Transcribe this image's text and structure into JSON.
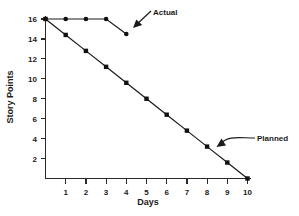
{
  "chart_data": {
    "type": "line",
    "title": "",
    "xlabel": "Days",
    "ylabel": "Story Points",
    "xlim": [
      0,
      10
    ],
    "ylim": [
      0,
      16
    ],
    "grid": false,
    "legend_position": "annotations",
    "x_ticks": [
      "1",
      "2",
      "3",
      "4",
      "5",
      "6",
      "7",
      "8",
      "9",
      "10"
    ],
    "x_tick_values": [
      1,
      2,
      3,
      4,
      5,
      6,
      7,
      8,
      9,
      10
    ],
    "y_ticks": [
      "2",
      "4",
      "6",
      "8",
      "10",
      "12",
      "14",
      "16"
    ],
    "y_tick_values": [
      2,
      4,
      6,
      8,
      10,
      12,
      14,
      16
    ],
    "series": [
      {
        "name": "Actual",
        "marker": "circle",
        "x": [
          0,
          1,
          2,
          3,
          4
        ],
        "values": [
          16,
          16,
          16,
          16,
          14.5
        ]
      },
      {
        "name": "Planned",
        "marker": "square",
        "x": [
          0,
          1,
          2,
          3,
          4,
          5,
          6,
          7,
          8,
          9,
          10
        ],
        "values": [
          16,
          14.4,
          12.8,
          11.2,
          9.6,
          8.0,
          6.4,
          4.8,
          3.2,
          1.6,
          0
        ]
      }
    ],
    "annotations": [
      {
        "label": "Actual",
        "target_x": 3.5,
        "target_y": 15.3,
        "style": "straight-arrow"
      },
      {
        "label": "Planned",
        "target_x": 8.5,
        "target_y": 2.4,
        "style": "curved-arrow"
      }
    ],
    "colors": {
      "actual_line": "#1a1a1a",
      "planned_line": "#1a1a1a",
      "axis": "#2a2a2a",
      "background": "#ffffff",
      "text": "#1a1a1a"
    }
  }
}
